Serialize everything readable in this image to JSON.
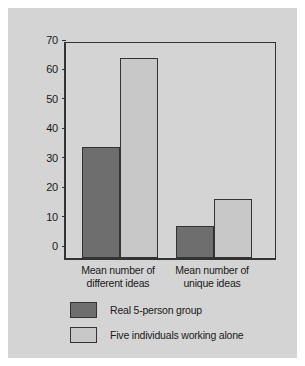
{
  "chart_data": {
    "type": "bar",
    "title": "",
    "subtitle": "",
    "xlabel": "",
    "ylabel": "",
    "ylim": [
      0,
      70
    ],
    "ytick_values": [
      0,
      10,
      20,
      30,
      40,
      50,
      60,
      70
    ],
    "ytick_labels": [
      "0",
      "10",
      "20",
      "30",
      "40",
      "50",
      "60",
      "70"
    ],
    "grid": false,
    "legend_position": "below-axes-left",
    "categories": [
      "Mean number of different ideas",
      "Mean number of unique ideas"
    ],
    "category_lines": [
      [
        "Mean number of",
        "different ideas"
      ],
      [
        "Mean number of",
        "unique ideas"
      ]
    ],
    "series": [
      {
        "name": "Real 5-person group",
        "color": "#6e6e6e",
        "values": [
          37.7,
          11
        ]
      },
      {
        "name": "Five individuals working alone",
        "color": "#c8c8c8",
        "values": [
          68,
          20
        ]
      }
    ]
  },
  "legend": {
    "items": [
      {
        "label": "Real 5-person group",
        "swatch": "dark"
      },
      {
        "label": "Five individuals working alone",
        "swatch": "light"
      }
    ]
  },
  "colors": {
    "page_background": "#ffffff",
    "card_background": "#d4d4d4",
    "axis": "#333333",
    "text": "#1a1a1a",
    "series_dark": "#6e6e6e",
    "series_light": "#c8c8c8"
  }
}
